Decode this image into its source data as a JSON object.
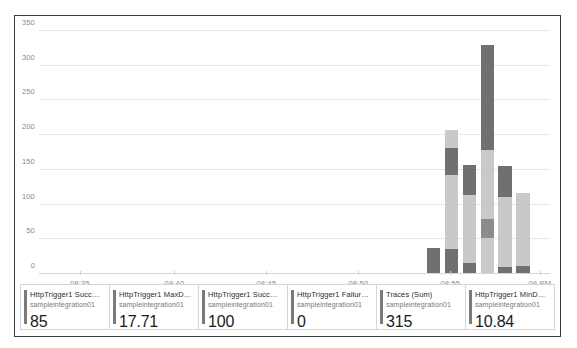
{
  "chart_data": {
    "type": "bar",
    "stacked": true,
    "title": "",
    "xlabel": "",
    "ylabel": "",
    "ylim": [
      0,
      360
    ],
    "yticks": [
      0,
      50,
      100,
      150,
      200,
      250,
      300,
      350
    ],
    "grid": true,
    "legend_position": "bottom",
    "xticks": [
      "08:35",
      "08:40",
      "08:45",
      "08:50",
      "08:55",
      "09 PM"
    ],
    "xtick_positions_pct": [
      8.0,
      26.5,
      44.5,
      62.5,
      80.5,
      98.0
    ],
    "bar_width_pct": 2.6,
    "colors": {
      "dark": "#707070",
      "light": "#c9c9c9",
      "mid": "#9a9a9a",
      "grid": "#e8e8e8",
      "axis": "#d8d8d8",
      "accent": "#7b7b7b"
    },
    "bars": [
      {
        "x_pct": 77.2,
        "total": 38,
        "segments": [
          {
            "value": 38,
            "color": "#707070",
            "name": "dark"
          }
        ]
      },
      {
        "x_pct": 80.7,
        "total": 208,
        "segments": [
          {
            "value": 36,
            "color": "#707070",
            "name": "dark"
          },
          {
            "value": 106,
            "color": "#c9c9c9",
            "name": "light"
          },
          {
            "value": 40,
            "color": "#707070",
            "name": "dark"
          },
          {
            "value": 26,
            "color": "#c9c9c9",
            "name": "light"
          }
        ]
      },
      {
        "x_pct": 84.2,
        "total": 157,
        "segments": [
          {
            "value": 16,
            "color": "#707070",
            "name": "dark"
          },
          {
            "value": 98,
            "color": "#c9c9c9",
            "name": "light"
          },
          {
            "value": 43,
            "color": "#707070",
            "name": "dark"
          }
        ]
      },
      {
        "x_pct": 87.7,
        "total": 330,
        "segments": [
          {
            "value": 52,
            "color": "#c9c9c9",
            "name": "light"
          },
          {
            "value": 27,
            "color": "#8c8c8c",
            "name": "mid"
          },
          {
            "value": 99,
            "color": "#c9c9c9",
            "name": "light"
          },
          {
            "value": 152,
            "color": "#707070",
            "name": "dark"
          }
        ]
      },
      {
        "x_pct": 91.2,
        "total": 155,
        "segments": [
          {
            "value": 10,
            "color": "#707070",
            "name": "dark"
          },
          {
            "value": 101,
            "color": "#c9c9c9",
            "name": "light"
          },
          {
            "value": 44,
            "color": "#707070",
            "name": "dark"
          }
        ]
      },
      {
        "x_pct": 94.7,
        "total": 116,
        "segments": [
          {
            "value": 12,
            "color": "#707070",
            "name": "dark"
          },
          {
            "value": 104,
            "color": "#c9c9c9",
            "name": "light"
          }
        ]
      }
    ]
  },
  "legend": {
    "cards": [
      {
        "title": "HttpTrigger1 Success...",
        "sub": "sampleintegration01",
        "value": "85"
      },
      {
        "title": "HttpTrigger1 MaxDura...",
        "sub": "sampleintegration01",
        "value": "17.71"
      },
      {
        "title": "HttpTrigger1 Success...",
        "sub": "sampleintegration01",
        "value": "100"
      },
      {
        "title": "HttpTrigger1 Failure...",
        "sub": "sampleintegration01",
        "value": "0"
      },
      {
        "title": "Traces (Sum)",
        "sub": "sampleintegration01",
        "value": "315"
      },
      {
        "title": "HttpTrigger1 MinDura...",
        "sub": "sampleintegration01",
        "value": "10.84"
      }
    ]
  }
}
